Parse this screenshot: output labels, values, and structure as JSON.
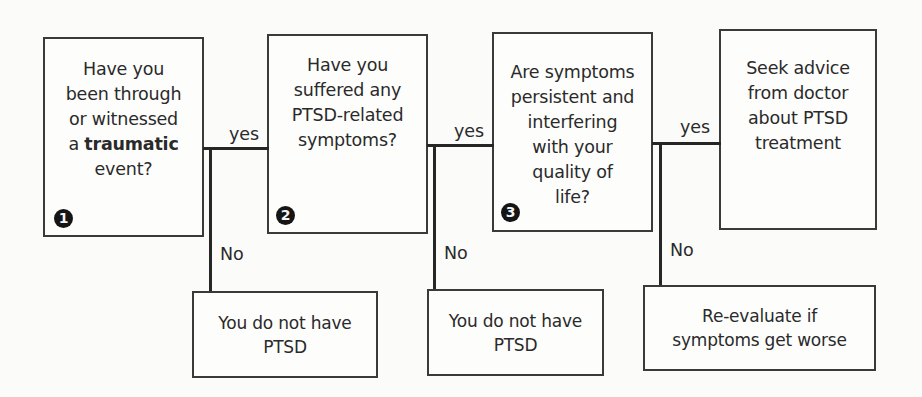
{
  "diagram": {
    "type": "flowchart",
    "steps": [
      {
        "number": "1",
        "lines": [
          "Have you",
          "been through",
          "or witnessed"
        ],
        "line_prefix": "a ",
        "emphasis": "traumatic",
        "last_line": "event?"
      },
      {
        "number": "2",
        "lines": [
          "Have you",
          "suffered any",
          "PTSD-related",
          "symptoms?"
        ]
      },
      {
        "number": "3",
        "lines": [
          "Are symptoms",
          "persistent and",
          "interfering",
          "with your",
          "quality of",
          "life?"
        ]
      }
    ],
    "outcome": {
      "lines": [
        "Seek advice",
        "from doctor",
        "about PTSD",
        "treatment"
      ]
    },
    "no_outcomes": [
      {
        "lines": [
          "You do not have",
          "PTSD"
        ]
      },
      {
        "lines": [
          "You do not have",
          "PTSD"
        ]
      },
      {
        "lines": [
          "Re-evaluate if",
          "symptoms get worse"
        ]
      }
    ],
    "edge_labels": {
      "yes": "yes",
      "no": "No"
    }
  }
}
